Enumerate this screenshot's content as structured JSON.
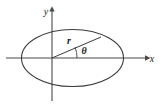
{
  "figure": {
    "background_color": "#ffffff",
    "stroke_color": "#3b3b3b",
    "axis_color": "#4a4a4a",
    "label_color": "#1a1a1a"
  },
  "axes": {
    "x_label": "x",
    "y_label": "y",
    "origin": {
      "x": 52,
      "y": 58
    },
    "x_axis": {
      "start_x": 6,
      "end_x": 148,
      "y": 58
    },
    "y_axis": {
      "x": 52,
      "start_y": 8,
      "end_y": 101
    }
  },
  "ellipse": {
    "center_x": 72.5,
    "center_y": 58,
    "radius_x": 51,
    "radius_y": 28.5
  },
  "radius_vector": {
    "label": "r",
    "from_x": 52,
    "from_y": 58,
    "to_x": 101,
    "to_y": 37,
    "label_x": 69,
    "label_y": 44
  },
  "angle": {
    "label": "θ",
    "label_x": 81,
    "label_y": 53,
    "arc_radius": 25,
    "vertex_x": 52,
    "vertex_y": 58
  }
}
